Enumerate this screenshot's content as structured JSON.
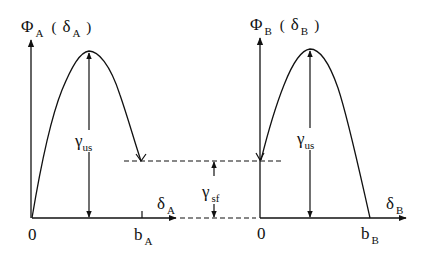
{
  "diagram": {
    "left_panel": {
      "y_axis_label": {
        "symbol": "Φ",
        "sub": "A",
        "open": "(",
        "arg": "δ",
        "arg_sub": "A",
        "close": ")"
      },
      "x_axis_label": {
        "symbol": "δ",
        "sub": "A"
      },
      "origin_label": "0",
      "end_label": {
        "symbol": "b",
        "sub": "A"
      },
      "height_label": {
        "symbol": "γ",
        "sub": "us"
      }
    },
    "right_panel": {
      "y_axis_label": {
        "symbol": "Φ",
        "sub": "B",
        "open": "(",
        "arg": "δ",
        "arg_sub": "B",
        "close": ")"
      },
      "x_axis_label": {
        "symbol": "δ",
        "sub": "B"
      },
      "origin_label": "0",
      "end_label": {
        "symbol": "b",
        "sub": "B"
      },
      "height_label": {
        "symbol": "γ",
        "sub": "us"
      }
    },
    "gap_label": {
      "symbol": "γ",
      "sub": "sf"
    },
    "colors": {
      "stroke": "#111111",
      "background": "#ffffff"
    }
  }
}
